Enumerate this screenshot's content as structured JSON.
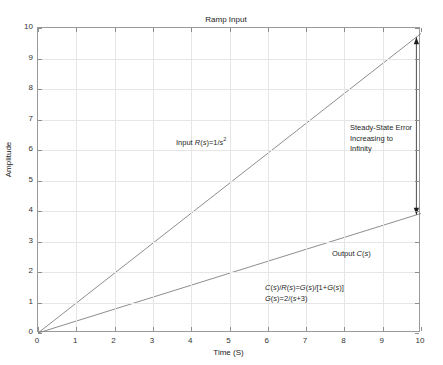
{
  "chart_data": {
    "type": "line",
    "title": "Ramp Input",
    "subtitle": "Unity Feedback",
    "xlabel": "Time (S)",
    "ylabel": "Amplitude",
    "xlim": [
      0,
      10
    ],
    "ylim": [
      0,
      10
    ],
    "xticks": [
      "0",
      "1",
      "2",
      "3",
      "4",
      "5",
      "6",
      "7",
      "8",
      "9",
      "10"
    ],
    "yticks": [
      "0",
      "1",
      "2",
      "3",
      "4",
      "5",
      "6",
      "7",
      "8",
      "9",
      "10"
    ],
    "grid": true,
    "legend": "none",
    "series": [
      {
        "name": "Input R(s)=1/s^2",
        "x": [
          0,
          10
        ],
        "values": [
          0,
          9.82
        ],
        "color": "#808080"
      },
      {
        "name": "Output C(s)",
        "x": [
          0,
          10
        ],
        "values": [
          0,
          3.92
        ],
        "color": "#808080"
      }
    ],
    "annotations": {
      "input_label": "Input R(s)=1/s",
      "input_label_exponent": "2",
      "output_label": "Output C(s)",
      "steady_state_error": [
        "Steady-State Error",
        "Increasing to",
        "Infinity"
      ],
      "formulas": [
        "C(s)/R(s)=G(s)/[1+G(s)]",
        "G(s)=2/(s+3)"
      ],
      "error_arrow": {
        "x": 9.88,
        "y_top": 9.7,
        "y_bottom": 3.88,
        "style": "double-headed"
      }
    }
  },
  "colors": {
    "background": "#ffffff",
    "frame": "#9a9a9a",
    "grid": "#e6e6e6",
    "line": "#808080",
    "text": "#222222"
  }
}
